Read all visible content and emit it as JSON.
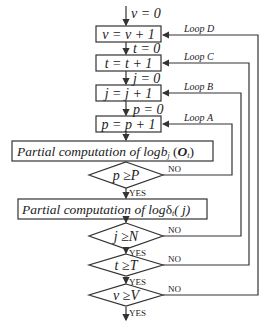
{
  "diagram": {
    "type": "flowchart",
    "init_labels": {
      "v_init": "v = 0",
      "t_init": "t = 0",
      "j_init": "j = 0",
      "p_init": "p = 0"
    },
    "process_boxes": {
      "v_inc": "v = v + 1",
      "t_inc": "t = t + 1",
      "j_inc": "j = j + 1",
      "p_inc": "p = p + 1",
      "partial_b_prefix": "Partial computation of log",
      "partial_b_b": "b",
      "partial_b_sub_j": "j",
      "partial_b_O": "O",
      "partial_b_sub_t": "t",
      "partial_delta_prefix": "Partial computation of log",
      "partial_delta_symbol": "δ",
      "partial_delta_sub_t": "t",
      "partial_delta_arg": "( j)"
    },
    "decisions": {
      "p_check": {
        "left": "p",
        "op": "≥",
        "right": "P"
      },
      "j_check": {
        "left": "j",
        "op": "≥",
        "right": "N"
      },
      "t_check": {
        "left": "t",
        "op": "≥",
        "right": "T"
      },
      "v_check": {
        "left": "v",
        "op": "≥",
        "right": "V"
      }
    },
    "branch_labels": {
      "yes": "YES",
      "no": "NO"
    },
    "loop_labels": {
      "loop_a": "Loop A",
      "loop_b": "Loop B",
      "loop_c": "Loop C",
      "loop_d": "Loop D"
    }
  }
}
